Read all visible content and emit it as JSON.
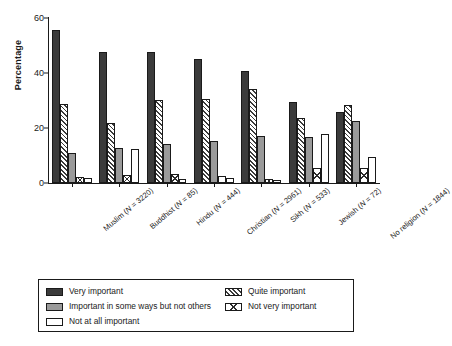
{
  "chart_data": {
    "type": "bar",
    "title": "",
    "xlabel": "",
    "ylabel": "Percentage",
    "ylim": [
      0,
      60
    ],
    "yticks": [
      0,
      20,
      40,
      60
    ],
    "grid": false,
    "legend_position": "bottom",
    "categories": [
      "Muslim (N = 3220)",
      "Buddhist (N = 85)",
      "Hindu (N = 444)",
      "Christian (N = 2961)",
      "Sikh (N = 533)",
      "Jewish (N = 72)",
      "No religion (N = 1844)"
    ],
    "category_parts": [
      {
        "name": "Muslim",
        "n": "3220"
      },
      {
        "name": "Buddhist",
        "n": "85"
      },
      {
        "name": "Hindu",
        "n": "444"
      },
      {
        "name": "Christian",
        "n": "2961"
      },
      {
        "name": "Sikh",
        "n": "533"
      },
      {
        "name": "Jewish",
        "n": "72"
      },
      {
        "name": "No religion",
        "n": "1844"
      }
    ],
    "series": [
      {
        "name": "Very important",
        "key": "very",
        "fill": "solid-dark",
        "color": "#3b3b3b",
        "values": [
          55.5,
          47.8,
          47.5,
          45.2,
          40.6,
          29.3,
          26.0
        ]
      },
      {
        "name": "Quite important",
        "key": "quite",
        "fill": "diagonal-hatch",
        "color": "#ffffff",
        "values": [
          28.6,
          21.8,
          30.2,
          30.7,
          34.3,
          23.6,
          28.4
        ]
      },
      {
        "name": "Important in some ways but not others",
        "key": "some",
        "fill": "solid-grey",
        "color": "#9a9a9a",
        "values": [
          11.0,
          12.6,
          14.2,
          15.1,
          17.1,
          16.8,
          22.4
        ]
      },
      {
        "name": "Not very important",
        "key": "notvery",
        "fill": "cross-hatch",
        "color": "#ffffff",
        "values": [
          2.3,
          3.0,
          3.2,
          2.6,
          1.5,
          5.5,
          5.3
        ]
      },
      {
        "name": "Not at all important",
        "key": "notatall",
        "fill": "open-white",
        "color": "#ffffff",
        "values": [
          1.9,
          12.5,
          1.6,
          1.9,
          1.1,
          18.0,
          9.4
        ]
      }
    ]
  },
  "legend": {
    "items": [
      {
        "label": "Very important",
        "fill": "solid-dark"
      },
      {
        "label": "Quite important",
        "fill": "diagonal-hatch"
      },
      {
        "label": "Important in some ways but not others",
        "fill": "solid-grey"
      },
      {
        "label": "Not very important",
        "fill": "cross-hatch"
      },
      {
        "label": "Not at all important",
        "fill": "open-white"
      }
    ]
  }
}
